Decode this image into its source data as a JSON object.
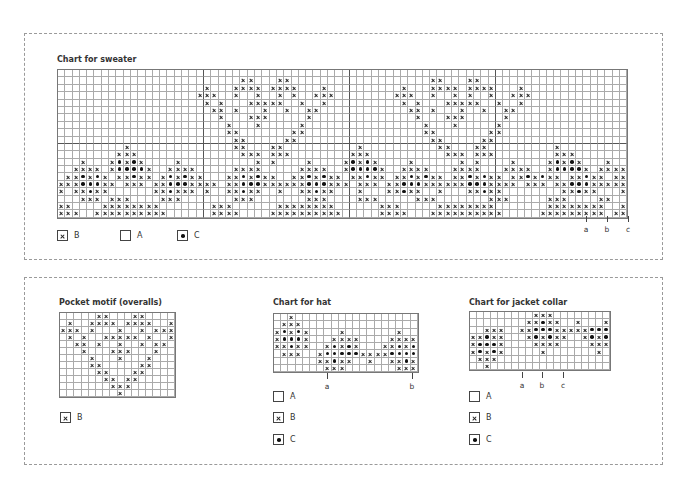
{
  "legend_key": {
    "A": "empty square (color A)",
    "B": "cross (color B)",
    "C": "dot (color C)"
  },
  "sweater": {
    "title": "Chart for sweater",
    "cols": 78,
    "rows": [
      "..............................................................................",
      ".........................xx...xx...................xx...xx....................",
      "....................x...xxxx.xxxx...x..........x...xxxx.xxxx...x..............",
      "...................xxx..x..x..x.x..xxx........xxx..x..x.x..x..xxx.............",
      "....................x.x...xxxxx..x..x..........x.x...xxxxx..x..x..............",
      ".....................xx.x...x..x..xx............xx.x...x..x..xx...............",
      "......................x...xxx.....x..............x...xxx.....x................",
      ".......................x...x.....x................x...x.....x.................",
      ".......................xx.......xx................xx.......xx..................",
      "........................xx.....xx..................xx.....xx...................",
      ".........x..............xx...xx..........x..........xx...xx.........x.........",
      "........xxx..............xxx.xxx........xxx..........xxx.xxx........xxx........",
      "...x...xoxox....x..........x.x....x....xoxox....x......x.x....x....xoxox...x...",
      "..xxxx.xoooox..xxxx.....xxxx.....xxxx..xoooox..xxxx...xxxx...xxxx..xoooox.xxxx",
      ".xxoxox.xxoxx.xoxoxx...xxoxoxx..xxoxoxx.xxoxx.xxoxoxx.xxoxoxx.xxoxoxx.xxoxx.xxox",
      "xxxoooxx.xxx.xxoooxxxx.xxoooxxxxxxoooxxx.xxx.xxoooxxxxxxoooxxxx.xxx.xxoooxxxxxx",
      "x.xxoxx......xxoxxx.x..xxoxx..x..xxoxx...x...xxoxx..x...xxoxx........xxoxx...xx",
      "...xxx.xxx....xxx.......xxx.......xxx....xxx.....xxx.......xxx.....xxx....xx..x",
      "xx....xxxxxxxx.......xxx......xxxxxxxx......xxx.....xxxxxxxx.......xxxxxxxx..xx",
      "xxx..xxxxxxxxxx......xxxx....xxxxxxxxxx.....xxxx...xxxxxxxxxx.....xxxxxxxxx.xxx"
    ],
    "markers": [
      "a",
      "b",
      "c"
    ],
    "legend": [
      {
        "symbol": "B",
        "label": "B"
      },
      {
        "symbol": "A",
        "label": "A"
      },
      {
        "symbol": "C",
        "label": "C"
      }
    ]
  },
  "pocket": {
    "title": "Pocket motif (overalls)",
    "cols": 16,
    "rows": [
      ".....xx...xx....",
      ".x..xxxx.xxxx..x",
      "xxx.x...x..x.xxx",
      ".x.x..xxxxx.x..x",
      "..xx.x..x..x.xx.",
      "...x...xxx...x..",
      "....x...x...x...",
      "....xx.....xx...",
      ".....xx...xx....",
      "......xx.xx.....",
      ".......xxx......",
      "........x......."
    ],
    "legend": [
      {
        "symbol": "B",
        "label": "B"
      }
    ]
  },
  "hat": {
    "title": "Chart for hat",
    "cols": 20,
    "rows": [
      "..x.................",
      ".xxx................",
      "xoxox....x.......x..",
      "xooox...xxxx....xxxx",
      "xxoxx..xoxox...xxoxox",
      ".xxx..xoooooxxxxoooox",
      "......xxoxx..x..xxoxx",
      ".......xxx.......xxx."
    ],
    "markers": [
      "a",
      "b"
    ],
    "legend": [
      {
        "symbol": "A",
        "label": "A"
      },
      {
        "symbol": "B",
        "label": "B"
      },
      {
        "symbol": "C",
        "label": "C"
      }
    ]
  },
  "collar": {
    "title": "Chart for jacket collar",
    "cols": 20,
    "rows": [
      ".........xxx.........",
      "........xxoxx..x...xx",
      "..xxx..xxoooxxxxxooo",
      "xxoxx...xoxoxx..xoxox",
      "xooox....xxxx....xxxx",
      "xoxox.....x.......x..",
      ".xxx................",
      "..x................."
    ],
    "markers": [
      "a",
      "b",
      "c"
    ],
    "legend": [
      {
        "symbol": "A",
        "label": "A"
      },
      {
        "symbol": "B",
        "label": "B"
      },
      {
        "symbol": "C",
        "label": "C"
      }
    ]
  }
}
